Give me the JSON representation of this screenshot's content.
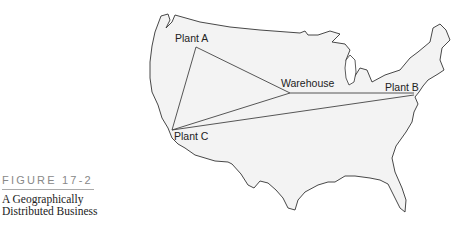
{
  "figure": {
    "number": "FIGURE 17-2",
    "title_line1": "A Geographically",
    "title_line2": "Distributed Business"
  },
  "map": {
    "region": "United States outline",
    "fill_color": "#f3f3f3",
    "stroke_color": "#333333",
    "locations": [
      {
        "id": "plant-a",
        "label": "Plant A"
      },
      {
        "id": "warehouse",
        "label": "Warehouse"
      },
      {
        "id": "plant-b",
        "label": "Plant B"
      },
      {
        "id": "plant-c",
        "label": "Plant C"
      }
    ],
    "connections": [
      [
        "Plant A",
        "Warehouse"
      ],
      [
        "Plant A",
        "Plant C"
      ],
      [
        "Plant C",
        "Warehouse"
      ],
      [
        "Plant C",
        "Plant B"
      ]
    ]
  }
}
